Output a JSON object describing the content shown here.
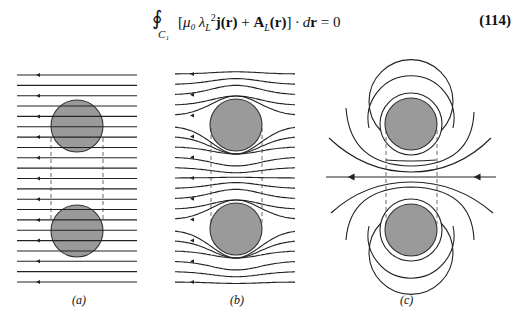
{
  "equation": {
    "integral_symbol": "∮",
    "contour_subscript": "C₁",
    "bracket_open": "[",
    "mu0": "μ₀",
    "lambda": "λ",
    "lambda_sub": "L",
    "lambda_sup": "2",
    "j_term": "j(r)",
    "plus": " + ",
    "A_term": "A",
    "A_sub": "L",
    "A_arg": "(r)",
    "bracket_close": "]",
    "dot_dr": " · d",
    "dr_r": "r",
    "equals_zero": " = 0",
    "number": "(114)"
  },
  "figure": {
    "panels": [
      {
        "id": "a",
        "label": "(a)",
        "description": "uniform parallel field lines through two cylinders"
      },
      {
        "id": "b",
        "label": "(b)",
        "description": "field lines expelled around two cylinders"
      },
      {
        "id": "c",
        "label": "(c)",
        "description": "field lines circulating around two cylinders"
      }
    ],
    "colors": {
      "disk_fill": "#9a9a9a",
      "line": "#222222",
      "dash": "#444444"
    }
  }
}
